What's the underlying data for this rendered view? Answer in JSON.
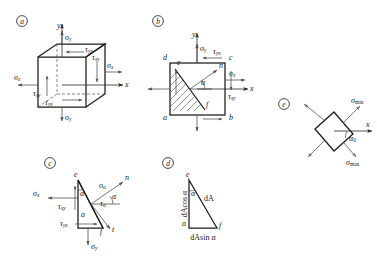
{
  "figure": {
    "background_color": "#ffffff",
    "line_color": "#1a1a1a",
    "arrow_color": "#4a4a4a"
  },
  "panels": {
    "a": {
      "tag": "a",
      "description": "Three-dimensional stress cube element with normal and shear stresses",
      "axes": {
        "x": "x",
        "y": "y"
      },
      "labels": {
        "sigma_x_left": "σ",
        "sigma_x_left_sub": "x",
        "sigma_x_right": "σ",
        "sigma_x_right_sub": "x",
        "sigma_y_top": "σ",
        "sigma_y_top_sub": "y",
        "sigma_y_bottom": "σ",
        "sigma_y_bottom_sub": "y",
        "tau_yx_top": "τ",
        "tau_yx_top_sub": "yx",
        "tau_yx_bottom": "τ",
        "tau_yx_bottom_sub": "yx",
        "tau_xy_right": "τ",
        "tau_xy_right_sub": "xy",
        "tau_xy_left": "τ",
        "tau_xy_left_sub": "xy"
      }
    },
    "b": {
      "tag": "b",
      "description": "Square stress element abcd with inclined section ef and normal n at angle alpha",
      "axes": {
        "x": "x",
        "y": "y"
      },
      "vertices": {
        "a": "a",
        "b": "b",
        "c": "c",
        "d": "d",
        "e": "e",
        "f": "f"
      },
      "labels": {
        "normal_n": "n",
        "angle_alpha": "α",
        "sigma_x": "σ",
        "sigma_x_sub": "x",
        "sigma_y": "σ",
        "sigma_y_sub": "y",
        "tau_yx": "τ",
        "tau_yx_sub": "yx",
        "tau_xy": "τ",
        "tau_xy_sub": "xy"
      }
    },
    "c": {
      "tag": "c",
      "description": "Free-body wedge aef with stresses sigma-alpha and tau-alpha on inclined face",
      "vertices": {
        "a": "a",
        "e": "e",
        "f": "f"
      },
      "labels": {
        "normal_n": "n",
        "tangent_t": "t",
        "angle_alpha_face": "α",
        "angle_alpha_corner": "α",
        "sigma_alpha": "σ",
        "sigma_alpha_sub": "α",
        "tau_alpha": "τ",
        "tau_alpha_sub": "α",
        "sigma_x": "σ",
        "sigma_x_sub": "x",
        "sigma_y": "σ",
        "sigma_y_sub": "y",
        "tau_xy": "τ",
        "tau_xy_sub": "xy",
        "tau_yx": "τ",
        "tau_yx_sub": "yx"
      }
    },
    "d": {
      "tag": "d",
      "description": "Area relations of the wedge faces",
      "vertices": {
        "a": "a",
        "e": "e",
        "f": "f"
      },
      "labels": {
        "hypotenuse_area": "dA",
        "vertical_area": "dAcos α",
        "horizontal_area": "dAsin α",
        "angle_alpha": "α"
      }
    },
    "e": {
      "tag": "e",
      "description": "Principal stress element rotated by alpha-zero showing sigma-max and sigma-min",
      "axes": {
        "x": "x"
      },
      "labels": {
        "sigma_min": "σ",
        "sigma_min_sub": "min",
        "sigma_max": "σ",
        "sigma_max_sub": "max",
        "angle_alpha0": "α",
        "angle_alpha0_sub": "0"
      }
    }
  }
}
